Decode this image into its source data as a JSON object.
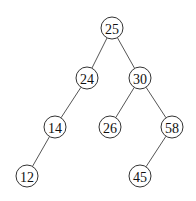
{
  "diagram": {
    "type": "binary-tree",
    "nodes": [
      {
        "id": "n25",
        "label": "25",
        "x": 112,
        "y": 28
      },
      {
        "id": "n24",
        "label": "24",
        "x": 87,
        "y": 78
      },
      {
        "id": "n30",
        "label": "30",
        "x": 140,
        "y": 78
      },
      {
        "id": "n14",
        "label": "14",
        "x": 55,
        "y": 127
      },
      {
        "id": "n26",
        "label": "26",
        "x": 110,
        "y": 127
      },
      {
        "id": "n58",
        "label": "58",
        "x": 172,
        "y": 127
      },
      {
        "id": "n12",
        "label": "12",
        "x": 27,
        "y": 176
      },
      {
        "id": "n45",
        "label": "45",
        "x": 140,
        "y": 176
      }
    ],
    "edges": [
      {
        "from": "n25",
        "to": "n24"
      },
      {
        "from": "n25",
        "to": "n30"
      },
      {
        "from": "n24",
        "to": "n14"
      },
      {
        "from": "n30",
        "to": "n26"
      },
      {
        "from": "n30",
        "to": "n58"
      },
      {
        "from": "n14",
        "to": "n12"
      },
      {
        "from": "n58",
        "to": "n45"
      }
    ],
    "node_radius": 11,
    "colors": {
      "edge": "#555555",
      "node_stroke": "#333333",
      "node_fill": "#ffffff",
      "text": "#111111"
    }
  }
}
